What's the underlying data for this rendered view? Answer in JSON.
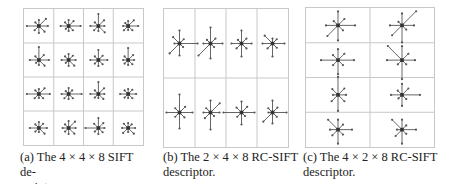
{
  "figure": {
    "panels": [
      {
        "id": "a",
        "caption_line1": "(a) The 4 × 4 × 8 SIFT de-",
        "caption_line2": "scriptor.",
        "rows": 4,
        "cols": 4,
        "cells": [
          [
            9,
            10,
            6,
            5,
            12,
            6,
            7,
            8
          ],
          [
            12,
            7,
            6,
            5,
            8,
            4,
            5,
            6
          ],
          [
            6,
            8,
            12,
            5,
            8,
            6,
            5,
            9
          ],
          [
            10,
            8,
            5,
            4,
            5,
            6,
            4,
            6
          ],
          [
            10,
            7,
            13,
            5,
            9,
            4,
            5,
            8
          ],
          [
            7,
            6,
            6,
            5,
            7,
            4,
            6,
            8
          ],
          [
            9,
            6,
            10,
            5,
            8,
            5,
            6,
            6
          ],
          [
            6,
            7,
            12,
            5,
            5,
            5,
            5,
            6
          ],
          [
            11,
            8,
            5,
            5,
            12,
            6,
            4,
            6
          ],
          [
            13,
            5,
            6,
            4,
            7,
            6,
            5,
            6
          ],
          [
            6,
            8,
            12,
            5,
            8,
            5,
            4,
            7
          ],
          [
            8,
            6,
            5,
            5,
            8,
            5,
            4,
            6
          ],
          [
            8,
            6,
            6,
            5,
            9,
            5,
            4,
            8
          ],
          [
            7,
            9,
            7,
            5,
            6,
            5,
            6,
            8
          ],
          [
            6,
            7,
            10,
            6,
            13,
            5,
            6,
            6
          ],
          [
            7,
            5,
            5,
            6,
            6,
            7,
            4,
            8
          ]
        ]
      },
      {
        "id": "b",
        "caption_line1": "(b) The 2 × 4 × 8 RC-SIFT",
        "caption_line2": "descriptor.",
        "rows": 2,
        "cols": 4,
        "cells": [
          [
            18,
            6,
            13,
            9,
            5,
            14,
            12,
            5
          ],
          [
            12,
            7,
            16,
            5,
            7,
            17,
            15,
            5
          ],
          [
            10,
            7,
            13,
            5,
            10,
            7,
            13,
            7
          ],
          [
            12,
            6,
            5,
            11,
            10,
            7,
            13,
            6
          ],
          [
            13,
            8,
            18,
            6,
            13,
            6,
            16,
            7
          ],
          [
            9,
            13,
            12,
            6,
            7,
            8,
            17,
            5
          ],
          [
            13,
            8,
            11,
            7,
            18,
            6,
            12,
            5
          ],
          [
            14,
            7,
            12,
            6,
            4,
            13,
            11,
            6
          ]
        ]
      },
      {
        "id": "c",
        "caption_line1": "(c) The 4 × 2 × 8 RC-SIFT",
        "caption_line2": "descriptor.",
        "rows": 4,
        "cols": 2,
        "cells": [
          [
            17,
            9,
            14,
            6,
            12,
            15,
            15,
            7
          ],
          [
            12,
            20,
            12,
            5,
            12,
            14,
            17,
            6
          ],
          [
            16,
            9,
            11,
            7,
            17,
            7,
            14,
            7
          ],
          [
            13,
            9,
            14,
            20,
            15,
            6,
            19,
            6
          ],
          [
            8,
            9,
            18,
            8,
            5,
            9,
            16,
            9
          ],
          [
            18,
            9,
            11,
            6,
            11,
            5,
            11,
            6
          ],
          [
            14,
            7,
            10,
            14,
            8,
            8,
            14,
            7
          ],
          [
            14,
            6,
            10,
            14,
            5,
            9,
            14,
            6
          ]
        ]
      }
    ]
  },
  "colors": {
    "grid_line": "#c8c8c8",
    "arrow": "#555555",
    "center_dot": "#333333",
    "caption_text": "#222222"
  }
}
